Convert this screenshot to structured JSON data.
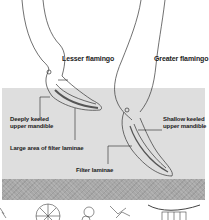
{
  "labels": {
    "lesser_flamingo": "Lesser flamingo",
    "greater_flamingo": "Greater flamingo",
    "deeply_keeled_line1": "Deeply keeled",
    "deeply_keeled_line2": "upper mandible",
    "shallow_keeled_line1": "Shallow keeled",
    "shallow_keeled_line2": "upper mandible",
    "large_area": "Large area of filter laminae",
    "filter_laminae": "Filter laminae"
  },
  "colors": {
    "background": "#ffffff",
    "water": "#dedede",
    "mud": "#a8a8a8",
    "ink": "#222222"
  }
}
